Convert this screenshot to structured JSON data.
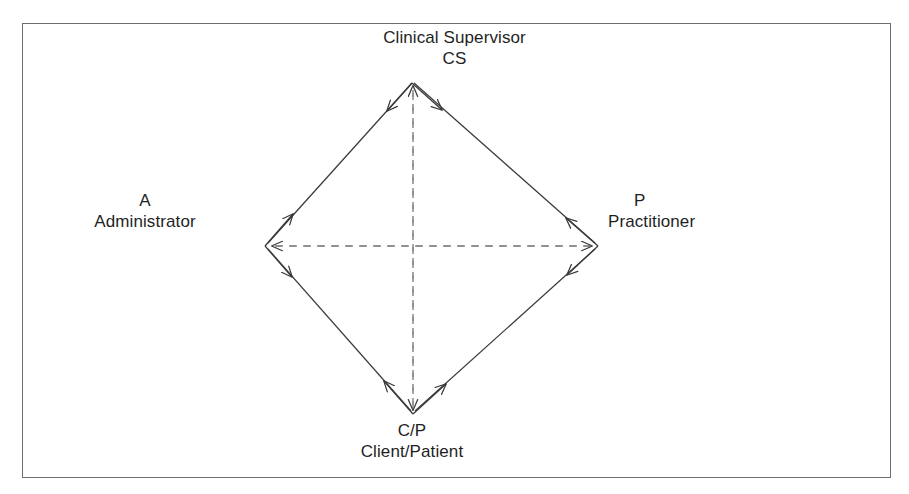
{
  "figure": {
    "border_color": "#6d6d6d",
    "line_color": "#3a3a3a",
    "text_color": "#1f1f1f",
    "background": "#ffffff"
  },
  "nodes": {
    "top": {
      "code": "CS",
      "name": "Clinical Supervisor"
    },
    "left": {
      "code": "A",
      "name": "Administrator"
    },
    "right": {
      "code": "P",
      "name": "Practitioner"
    },
    "bottom": {
      "code": "C/P",
      "name": "Client/Patient"
    }
  },
  "edges": [
    {
      "id": "cs-a",
      "from": "CS",
      "to": "A",
      "style": "solid",
      "arrows": "both"
    },
    {
      "id": "cs-p",
      "from": "CS",
      "to": "P",
      "style": "solid",
      "arrows": "both"
    },
    {
      "id": "a-cp",
      "from": "A",
      "to": "C/P",
      "style": "solid",
      "arrows": "both"
    },
    {
      "id": "p-cp",
      "from": "P",
      "to": "C/P",
      "style": "solid",
      "arrows": "both"
    },
    {
      "id": "cs-cp",
      "from": "CS",
      "to": "C/P",
      "style": "dashed",
      "arrows": "both"
    },
    {
      "id": "a-p",
      "from": "A",
      "to": "P",
      "style": "dashed",
      "arrows": "both"
    }
  ]
}
